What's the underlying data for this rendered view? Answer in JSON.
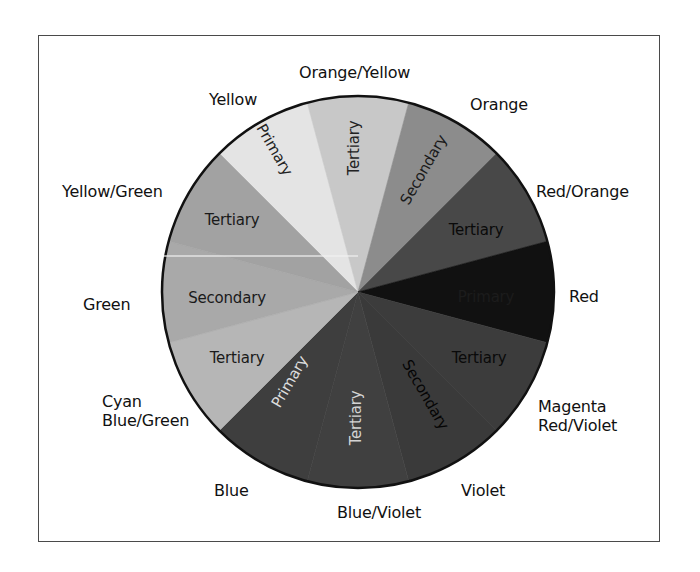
{
  "diagram": {
    "title": "",
    "type": "color-wheel",
    "center": [
      358,
      292
    ],
    "radius": 196,
    "outline_color": "#111111",
    "frame_color": "#4a4a4a",
    "wedges": [
      {
        "hue": "Yellow",
        "category": "Primary",
        "start": 225,
        "end": 255,
        "fill": "#e4e4e4",
        "text_color": "#222222",
        "label_pos": [
          274,
          150
        ],
        "label_rotate": 60
      },
      {
        "hue": "Orange/Yellow",
        "category": "Tertiary",
        "start": 255,
        "end": 285,
        "fill": "#c8c8c8",
        "text_color": "#222222",
        "label_pos": [
          354,
          148
        ],
        "label_rotate": -90
      },
      {
        "hue": "Orange",
        "category": "Secondary",
        "start": 285,
        "end": 315,
        "fill": "#8c8c8c",
        "text_color": "#1a1a1a",
        "label_pos": [
          424,
          170
        ],
        "label_rotate": -60
      },
      {
        "hue": "Red/Orange",
        "category": "Tertiary",
        "start": 315,
        "end": 345,
        "fill": "#484848",
        "text_color": "#0a0a0a",
        "label_pos": [
          476,
          230
        ],
        "label_rotate": 0
      },
      {
        "hue": "Red",
        "category": "Primary",
        "start": 345,
        "end": 375,
        "fill": "#111111",
        "text_color": "#1c1c1c",
        "label_pos": [
          486,
          297
        ],
        "label_rotate": 0
      },
      {
        "hue": "Magenta Red/Violet",
        "category": "Tertiary",
        "start": 15,
        "end": 45,
        "fill": "#3c3c3c",
        "text_color": "#0a0a0a",
        "label_pos": [
          479,
          358
        ],
        "label_rotate": 0
      },
      {
        "hue": "Violet",
        "category": "Secondary",
        "start": 45,
        "end": 75,
        "fill": "#3a3a3a",
        "text_color": "#050505",
        "label_pos": [
          425,
          395
        ],
        "label_rotate": 60
      },
      {
        "hue": "Blue/Violet",
        "category": "Tertiary",
        "start": 75,
        "end": 105,
        "fill": "#404040",
        "text_color": "#d4d4d4",
        "label_pos": [
          356,
          418
        ],
        "label_rotate": -90
      },
      {
        "hue": "Blue",
        "category": "Primary",
        "start": 105,
        "end": 135,
        "fill": "#3e3e3e",
        "text_color": "#dcdcdc",
        "label_pos": [
          290,
          382
        ],
        "label_rotate": -60
      },
      {
        "hue": "Cyan Blue/Green",
        "category": "Tertiary",
        "start": 135,
        "end": 165,
        "fill": "#b6b6b6",
        "text_color": "#1a1a1a",
        "label_pos": [
          237,
          358
        ],
        "label_rotate": 0
      },
      {
        "hue": "Green",
        "category": "Secondary",
        "start": 165,
        "end": 195,
        "fill": "#a9a9a9",
        "text_color": "#1a1a1a",
        "label_pos": [
          227,
          298
        ],
        "label_rotate": 0
      },
      {
        "hue": "Yellow/Green",
        "category": "Tertiary",
        "start": 195,
        "end": 225,
        "fill": "#a2a2a2",
        "text_color": "#1a1a1a",
        "label_pos": [
          232,
          220
        ],
        "label_rotate": 0
      }
    ],
    "outer_labels": [
      {
        "text": "Orange/Yellow",
        "left": 299,
        "top": 63
      },
      {
        "text": "Yellow",
        "left": 209,
        "top": 90
      },
      {
        "text": "Orange",
        "left": 470,
        "top": 95
      },
      {
        "text": "Yellow/Green",
        "left": 62,
        "top": 182
      },
      {
        "text": "Red/Orange",
        "left": 536,
        "top": 182
      },
      {
        "text": "Green",
        "left": 83,
        "top": 295
      },
      {
        "text": "Red",
        "left": 569,
        "top": 287
      },
      {
        "text": "Cyan\nBlue/Green",
        "left": 102,
        "top": 392
      },
      {
        "text": "Magenta\nRed/Violet",
        "left": 538,
        "top": 397
      },
      {
        "text": "Blue",
        "left": 214,
        "top": 481
      },
      {
        "text": "Violet",
        "left": 461,
        "top": 481
      },
      {
        "text": "Blue/Violet",
        "left": 337,
        "top": 503
      }
    ]
  }
}
